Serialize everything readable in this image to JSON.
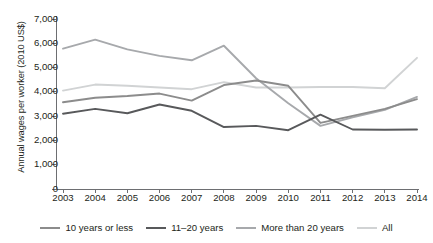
{
  "chart_data": {
    "type": "line",
    "title": "",
    "xlabel": "",
    "ylabel": "Annual wages per worker (2010 US$)",
    "x": [
      2003,
      2004,
      2005,
      2006,
      2007,
      2008,
      2009,
      2010,
      2011,
      2012,
      2013,
      2014
    ],
    "categories": [
      "2003",
      "2004",
      "2005",
      "2006",
      "2007",
      "2008",
      "2009",
      "2010",
      "2011",
      "2012",
      "2013",
      "2014"
    ],
    "ylim": [
      0,
      7000
    ],
    "ytick_values": [
      0,
      1000,
      2000,
      3000,
      4000,
      5000,
      6000,
      7000
    ],
    "ytick_labels": [
      "0",
      "1,000",
      "2,000",
      "3,000",
      "4,000",
      "5,000",
      "6,000",
      "7,000"
    ],
    "grid": false,
    "legend_position": "bottom",
    "series": [
      {
        "name": "10 years or less",
        "color": "#8c8c8c",
        "values": [
          3570,
          3760,
          3830,
          3930,
          3640,
          4280,
          4470,
          4250,
          2720,
          3010,
          3300,
          3700
        ]
      },
      {
        "name": "11–20 years",
        "color": "#58595b",
        "values": [
          3100,
          3300,
          3120,
          3480,
          3220,
          2550,
          2600,
          2420,
          3060,
          2450,
          2440,
          2450
        ]
      },
      {
        "name": "More than 20 years",
        "color": "#a7a9ac",
        "values": [
          5780,
          6150,
          5750,
          5480,
          5300,
          5900,
          4560,
          3530,
          2600,
          2950,
          3260,
          3790
        ]
      },
      {
        "name": "All",
        "color": "#d1d3d4",
        "values": [
          4050,
          4300,
          4250,
          4180,
          4110,
          4400,
          4180,
          4180,
          4200,
          4200,
          4150,
          5400
        ]
      }
    ]
  },
  "axes": {
    "y_title": "Annual wages per worker (2010 US$)",
    "y_ticks": [
      "7,000",
      "6,000",
      "5,000",
      "4,000",
      "3,000",
      "2,000",
      "1,000",
      "0"
    ],
    "x_ticks": [
      "2003",
      "2004",
      "2005",
      "2006",
      "2007",
      "2008",
      "2009",
      "2010",
      "2011",
      "2012",
      "2013",
      "2014"
    ]
  },
  "legend": {
    "items": [
      {
        "label": "10 years or less",
        "color": "#8c8c8c"
      },
      {
        "label": "11–20 years",
        "color": "#58595b"
      },
      {
        "label": "More than 20 years",
        "color": "#a7a9ac"
      },
      {
        "label": "All",
        "color": "#d1d3d4"
      }
    ]
  },
  "colors": {
    "axis": "#6d6e71",
    "text": "#231f20",
    "background": "#ffffff"
  }
}
